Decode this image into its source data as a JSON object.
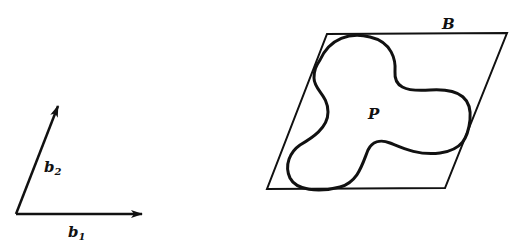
{
  "labels": {
    "b1": "b",
    "b1_sub": "1",
    "b2": "b",
    "b2_sub": "2",
    "B": "B",
    "P": "P"
  },
  "colors": {
    "stroke": "#111111",
    "background": "#ffffff"
  }
}
